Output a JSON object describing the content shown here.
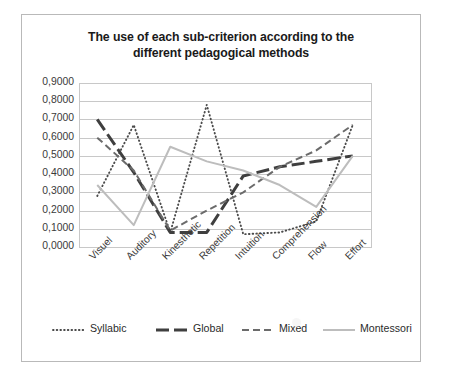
{
  "figure": {
    "title": "The use of each sub-criterion according to the different pedagogical methods",
    "title_line1": "The use of each sub-criterion according to the",
    "title_line2": "different pedagogical methods",
    "caption": ""
  },
  "axis": {
    "y_ticks": [
      "0,9000",
      "0,8000",
      "0,7000",
      "0,6000",
      "0,5000",
      "0,4000",
      "0,3000",
      "0,2000",
      "0,1000",
      "0,0000"
    ],
    "x_ticks": [
      "Visuel",
      "Auditory",
      "Kinesthetic",
      "Repetition",
      "Intuition",
      "Comprehension",
      "Flow",
      "Effort"
    ]
  },
  "legend": {
    "items": [
      {
        "label": "Syllabic",
        "style": "dotted",
        "color": "#4a4a4a"
      },
      {
        "label": "Global",
        "style": "thick-dash",
        "color": "#3f3f3f"
      },
      {
        "label": "Mixed",
        "style": "dashed",
        "color": "#6b6b6b"
      },
      {
        "label": "Montessori",
        "style": "solid",
        "color": "#bdbdbd"
      }
    ]
  },
  "chart_data": {
    "type": "line",
    "title": "The use of each sub-criterion according to the different pedagogical methods",
    "xlabel": "",
    "ylabel": "",
    "ylim": [
      0.0,
      0.9
    ],
    "ytick_step": 0.1,
    "grid": true,
    "legend_position": "bottom",
    "categories": [
      "Visuel",
      "Auditory",
      "Kinesthetic",
      "Repetition",
      "Intuition",
      "Comprehension",
      "Flow",
      "Effort"
    ],
    "series": [
      {
        "name": "Syllabic",
        "style": "dotted",
        "color": "#4a4a4a",
        "values": [
          0.28,
          0.67,
          0.08,
          0.78,
          0.07,
          0.08,
          0.14,
          0.67
        ]
      },
      {
        "name": "Global",
        "style": "thick-dash",
        "color": "#3f3f3f",
        "values": [
          0.7,
          0.41,
          0.08,
          0.08,
          0.39,
          0.44,
          0.47,
          0.5
        ]
      },
      {
        "name": "Mixed",
        "style": "dashed",
        "color": "#6b6b6b",
        "values": [
          0.6,
          0.42,
          0.09,
          0.2,
          0.3,
          0.44,
          0.53,
          0.67
        ]
      },
      {
        "name": "Montessori",
        "style": "solid",
        "color": "#bdbdbd",
        "values": [
          0.34,
          0.12,
          0.55,
          0.47,
          0.42,
          0.34,
          0.22,
          0.5
        ]
      }
    ]
  }
}
